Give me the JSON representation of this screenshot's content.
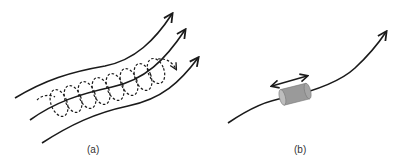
{
  "figure": {
    "panels": [
      {
        "id": "a",
        "label": "(a)",
        "description": "Three curved field lines with arrows; a dashed helical trajectory winds around the middle line, ending in a dashed arrow"
      },
      {
        "id": "b",
        "label": "(b)",
        "description": "Single curved field line with arrow; a gray cylinder threaded on the line with a double-headed arrow above it"
      }
    ]
  },
  "colors": {
    "line": "#1a1a1a",
    "cylinder_fill": "#9a9a9a",
    "cylinder_end": "#bdbdbd",
    "background": "#ffffff"
  }
}
